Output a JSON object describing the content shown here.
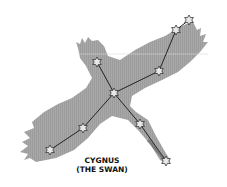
{
  "title": "CYGNUS",
  "subtitle": "(THE SWAN)",
  "colors": {
    "background": "#ffffff",
    "silhouette": "#a3a3a3",
    "lines": "#222222",
    "star_fill": "#e8e8e8",
    "star_stroke": "#333333"
  },
  "stars": [
    {
      "id": "wing-tip-right-outer",
      "x": 189,
      "y": 20
    },
    {
      "id": "wing-tip-right",
      "x": 176,
      "y": 30
    },
    {
      "id": "wing-right-mid",
      "x": 159,
      "y": 71
    },
    {
      "id": "neck",
      "x": 97,
      "y": 62
    },
    {
      "id": "center-sadr",
      "x": 114,
      "y": 93
    },
    {
      "id": "body-lower",
      "x": 140,
      "y": 124
    },
    {
      "id": "tail",
      "x": 166,
      "y": 161
    },
    {
      "id": "wing-left-mid",
      "x": 83,
      "y": 128
    },
    {
      "id": "wing-tip-left",
      "x": 50,
      "y": 150
    }
  ]
}
